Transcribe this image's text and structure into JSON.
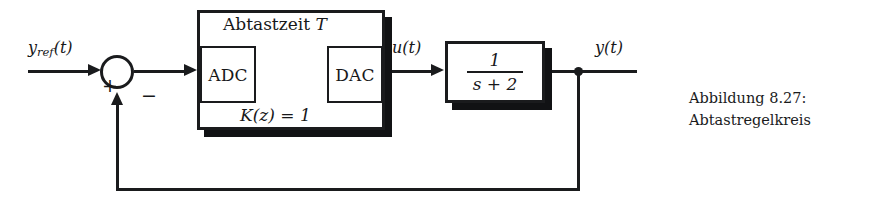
{
  "figure": {
    "caption_line1": "Abbildung 8.27:",
    "caption_line2": "Abtastregelkreis",
    "background_color": "#ffffff",
    "ink_color": "#1a1b1d"
  },
  "signals": {
    "reference_base": "y",
    "reference_sub": "ref",
    "reference_arg": "(t)",
    "control": "u(t)",
    "output": "y(t)"
  },
  "summing_junction": {
    "positive_sign": "+",
    "negative_sign": "−"
  },
  "digital_controller": {
    "top_label_text": "Abtastzeit",
    "top_label_symbol": "T",
    "bottom_label": "K(z) = 1",
    "adc_label": "ADC",
    "dac_label": "DAC"
  },
  "plant": {
    "numerator": "1",
    "denominator": "s + 2"
  }
}
